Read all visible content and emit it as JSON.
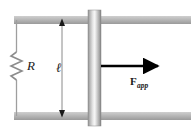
{
  "figure": {
    "background_color": "#ffffff",
    "width": 191,
    "height": 134
  },
  "labels": {
    "resistance": "R",
    "length": "ℓ",
    "force_symbol": "F",
    "force_subscript": "app"
  },
  "colors": {
    "rail_light": "#c2c2c2",
    "rail_mid": "#a8a8a8",
    "rail_dark": "#8f8f8f",
    "bar_edge": "#8a8a8a",
    "bar_highlight": "#f2f2f2",
    "bar_mid": "#c8c8c8",
    "wire": "#9a9a9a",
    "resistor": "#8c8c8c",
    "arrow": "#000000",
    "dimension_line": "#808080",
    "text": "#1a1a1a"
  },
  "geometry": {
    "top_rail": {
      "x": 14,
      "y": 16,
      "width": 177,
      "height": 8
    },
    "bottom_rail": {
      "x": 14,
      "y": 112,
      "width": 177,
      "height": 8
    },
    "left_wire_x": 16,
    "slider_bar": {
      "x": 88,
      "y": 10,
      "width": 13,
      "height": 116
    },
    "dimension_line_x": 62,
    "dimension_top_y": 20,
    "dimension_bottom_y": 116,
    "force_arrow": {
      "x1": 101,
      "y1": 66,
      "x2": 163,
      "y2": 66
    }
  },
  "icon_names": {
    "resistor": "resistor-zigzag-icon",
    "force_arrow": "force-arrow-icon",
    "dimension_arrow": "dimension-double-arrow-icon"
  }
}
